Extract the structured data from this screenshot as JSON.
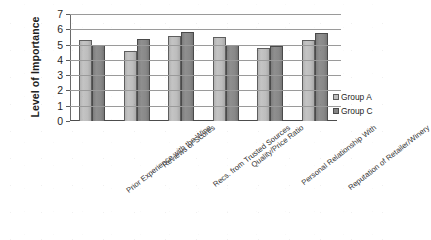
{
  "chart_data": {
    "type": "bar",
    "title": "",
    "xlabel": "",
    "ylabel": "Level of Importance",
    "ylim": [
      0,
      7
    ],
    "ytick_labels": [
      "7",
      "6",
      "5",
      "4",
      "3",
      "2",
      "1",
      "0"
    ],
    "ytick_values": [
      7,
      6,
      5,
      4,
      3,
      2,
      1,
      0
    ],
    "grid": true,
    "legend_position": "right",
    "categories": [
      "Prior Experience with the Wine",
      "Reviews or Scores",
      "Recs. from Trusted Sources",
      "Quality/Price Ratio",
      "Personal Relationship With",
      "Reputation of Retailer/Winery"
    ],
    "series": [
      {
        "name": "Group A",
        "color": "#bdbdbd",
        "values": [
          5.3,
          4.6,
          5.55,
          5.5,
          4.75,
          5.3
        ]
      },
      {
        "name": "Group C",
        "color": "#858585",
        "values": [
          5.0,
          5.35,
          5.85,
          5.0,
          4.9,
          5.75
        ]
      }
    ]
  },
  "legend": {
    "items": [
      {
        "label": "Group A",
        "swatch": "series-a"
      },
      {
        "label": "Group C",
        "swatch": "series-c"
      }
    ]
  }
}
